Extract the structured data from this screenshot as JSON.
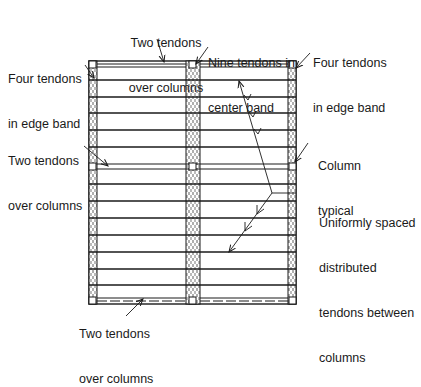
{
  "diagram": {
    "type": "two-way post-tensioned flat plate tendon layout (plan view)",
    "colors": {
      "ink": "#1a1a1a",
      "background": "#ffffff",
      "band_fill": "#ffffff"
    },
    "labels": {
      "top_center": {
        "line1": "Two tendons",
        "line2": "over columns"
      },
      "top_left": {
        "line1": "Four tendons",
        "line2": "in edge band"
      },
      "top_middle": {
        "line1": "Nine tendons in",
        "line2": "center band"
      },
      "top_right": {
        "line1": "Four tendons",
        "line2": "in edge band"
      },
      "mid_left": {
        "line1": "Two tendons",
        "line2": "over columns"
      },
      "mid_right": {
        "line1": "Column",
        "line2": "typical"
      },
      "right_lower": {
        "line1": "Uniformly spaced",
        "line2": "distributed",
        "line3": "tendons between",
        "line4": "columns"
      },
      "bottom": {
        "line1": "Two tendons",
        "line2": "over columns"
      }
    },
    "slab": {
      "bays_x": 2,
      "bays_y": 2,
      "distributed_tendons_top_bay": 5,
      "distributed_tendons_bottom_bay": 7,
      "columns": 9
    }
  }
}
